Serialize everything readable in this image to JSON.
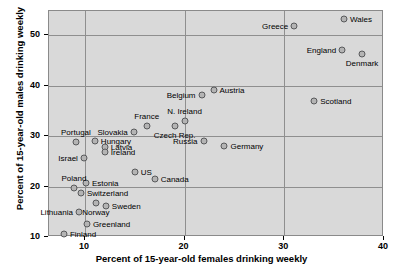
{
  "chart_data": {
    "type": "scatter",
    "title": "",
    "xlabel": "Percent of 15-year-old females drinking weekly",
    "ylabel": "Percent of 15-year-old males drinking weekly",
    "xlim": [
      6.4,
      40
    ],
    "ylim": [
      10,
      54.8
    ],
    "xticks": [
      10,
      20,
      30,
      40
    ],
    "yticks": [
      10,
      20,
      30,
      40,
      50
    ],
    "grid": true,
    "legend": "none",
    "points": [
      {
        "label": "Greece",
        "x": 31.0,
        "y": 51.8,
        "pos": "left"
      },
      {
        "label": "Wales",
        "x": 36.0,
        "y": 53.2,
        "pos": "right"
      },
      {
        "label": "England",
        "x": 35.8,
        "y": 47.0,
        "pos": "left"
      },
      {
        "label": "Denmark",
        "x": 37.8,
        "y": 46.2,
        "pos": "below"
      },
      {
        "label": "Scotland",
        "x": 33.0,
        "y": 37.0,
        "pos": "right"
      },
      {
        "label": "Austria",
        "x": 22.9,
        "y": 39.2,
        "pos": "right"
      },
      {
        "label": "Belgium",
        "x": 21.7,
        "y": 38.1,
        "pos": "left"
      },
      {
        "label": "N. Ireland",
        "x": 20.0,
        "y": 33.0,
        "pos": "above"
      },
      {
        "label": "Czech Rep.",
        "x": 19.0,
        "y": 32.1,
        "pos": "below"
      },
      {
        "label": "Russia",
        "x": 21.9,
        "y": 29.0,
        "pos": "left"
      },
      {
        "label": "Germany",
        "x": 24.0,
        "y": 28.0,
        "pos": "right"
      },
      {
        "label": "France",
        "x": 16.2,
        "y": 32.0,
        "pos": "above"
      },
      {
        "label": "Slovakia",
        "x": 14.9,
        "y": 30.9,
        "pos": "left"
      },
      {
        "label": "Hungary",
        "x": 11.0,
        "y": 29.0,
        "pos": "right"
      },
      {
        "label": "Latvia",
        "x": 12.0,
        "y": 27.9,
        "pos": "right"
      },
      {
        "label": "Ireland",
        "x": 12.0,
        "y": 26.9,
        "pos": "right"
      },
      {
        "label": "Portugal",
        "x": 9.1,
        "y": 28.9,
        "pos": "above"
      },
      {
        "label": "Israel",
        "x": 9.9,
        "y": 25.7,
        "pos": "left"
      },
      {
        "label": "US",
        "x": 15.0,
        "y": 22.8,
        "pos": "right"
      },
      {
        "label": "Canada",
        "x": 17.0,
        "y": 21.5,
        "pos": "right"
      },
      {
        "label": "Poland",
        "x": 8.9,
        "y": 19.8,
        "pos": "above"
      },
      {
        "label": "Estonia",
        "x": 10.1,
        "y": 20.7,
        "pos": "right"
      },
      {
        "label": "Switzerland",
        "x": 9.6,
        "y": 18.7,
        "pos": "right"
      },
      {
        "label": "Norway",
        "x": 11.1,
        "y": 16.7,
        "pos": "below"
      },
      {
        "label": "Sweden",
        "x": 12.1,
        "y": 16.1,
        "pos": "right"
      },
      {
        "label": "Lithuania",
        "x": 9.4,
        "y": 14.9,
        "pos": "left"
      },
      {
        "label": "Greenland",
        "x": 10.2,
        "y": 12.5,
        "pos": "right"
      },
      {
        "label": "Finland",
        "x": 7.9,
        "y": 10.6,
        "pos": "right"
      }
    ],
    "colors": {
      "plot_background": "#d9d9d9",
      "marker_fill": "#b4b4b4",
      "marker_edge": "#58595b",
      "gridline": "#8f8f8f",
      "text": "#000000"
    }
  }
}
